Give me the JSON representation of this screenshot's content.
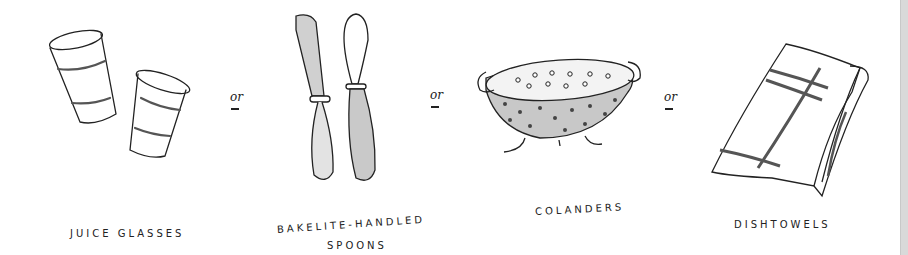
{
  "items": [
    {
      "label": "JUICE GLASSES",
      "icon": "juice-glasses"
    },
    {
      "label": "BAKELITE-HANDLED",
      "label_line2": "SPOONS",
      "icon": "bakelite-spoons"
    },
    {
      "label": "COLANDERS",
      "icon": "colander"
    },
    {
      "label": "DISHTOWELS",
      "icon": "dishtowels"
    }
  ],
  "separators": [
    "or",
    "or",
    "or"
  ],
  "colors": {
    "ink": "#222222",
    "shade": "#bdbdbd",
    "background": "#ffffff",
    "edge": "#d9d9d9"
  }
}
